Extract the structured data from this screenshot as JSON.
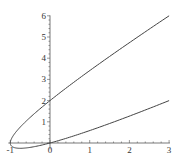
{
  "chart_data": {
    "type": "line",
    "title": "",
    "xlabel": "",
    "ylabel": "",
    "parametric": {
      "x_expr": "t^2 - 1",
      "y_expr": "t^2 + t",
      "t_range": [
        -2,
        2
      ]
    },
    "series": [
      {
        "name": "parametric curve",
        "x": [
          3,
          2.24,
          1.56,
          0.96,
          0.44,
          0,
          -0.36,
          -0.64,
          -0.84,
          -0.96,
          -1,
          -0.96,
          -0.84,
          -0.64,
          -0.36,
          0,
          0.44,
          0.96,
          1.56,
          2.24,
          3
        ],
        "y": [
          2,
          1.44,
          0.96,
          0.56,
          0.24,
          0,
          -0.16,
          -0.24,
          -0.24,
          -0.16,
          0,
          0.24,
          0.56,
          0.96,
          1.44,
          2,
          2.64,
          3.36,
          4.16,
          5.04,
          6
        ]
      }
    ],
    "xlim": [
      -1,
      3
    ],
    "ylim": [
      -0.3,
      6
    ],
    "x_ticks": [
      "-1",
      "0",
      "1",
      "2",
      "3"
    ],
    "y_ticks": [
      "1",
      "2",
      "3",
      "4",
      "5",
      "6"
    ],
    "grid": false,
    "legend": "none",
    "line_color": "#444444",
    "axis_color": "#555555"
  }
}
